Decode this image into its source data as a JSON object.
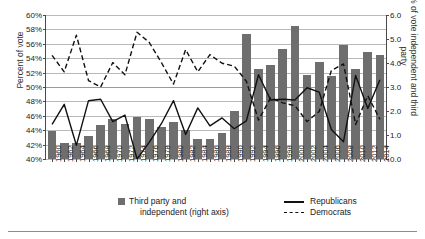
{
  "axes": {
    "ylabel_left": "Percent of vote",
    "ylabel_right": "% of vote independent and third party",
    "left_ticks": [
      "40%",
      "42%",
      "44%",
      "46%",
      "48%",
      "50%",
      "52%",
      "54%",
      "56%",
      "58%",
      "60%"
    ],
    "right_ticks": [
      "0.0",
      "1.0",
      "2.0",
      "3.0",
      "4.0",
      "5.0",
      "6.0"
    ]
  },
  "legend": {
    "bars_line1": "Third party and",
    "bars_line2": "independent (right axis)",
    "republicans": "Republicans",
    "democrats": "Democrats"
  },
  "colors": {
    "bar": "#6e6e6e",
    "republican_line": "#111111",
    "democrat_line": "#111111",
    "grid": "#b9b9b9",
    "axis": "#4a4a4a"
  },
  "chart_data": {
    "type": "bar",
    "title": "",
    "xlabel": "",
    "ylabel": "Percent of vote",
    "ylabel_secondary": "% of vote independent and third party",
    "ylim": [
      40,
      60
    ],
    "ylim_secondary": [
      0.0,
      6.0
    ],
    "grid": true,
    "legend_position": "bottom",
    "categories": [
      "1960",
      "1962",
      "1964",
      "1966",
      "1968",
      "1970",
      "1972",
      "1974",
      "1976",
      "1978",
      "1980",
      "1982",
      "1984",
      "1986",
      "1988",
      "1990",
      "1992",
      "1994",
      "1996",
      "1998",
      "2000",
      "2002",
      "2004",
      "2006",
      "2008",
      "2010",
      "2012",
      "2014"
    ],
    "series": [
      {
        "name": "Third party and independent (right axis)",
        "type": "bar",
        "axis": "right",
        "values": [
          1.15,
          0.65,
          0.65,
          0.95,
          1.4,
          1.65,
          1.45,
          1.75,
          1.65,
          1.35,
          1.55,
          1.2,
          0.85,
          0.85,
          1.1,
          2.0,
          5.2,
          3.75,
          3.9,
          4.6,
          5.55,
          3.5,
          4.05,
          3.45,
          4.75,
          3.75,
          4.45,
          4.35
        ]
      },
      {
        "name": "Republicans",
        "type": "line",
        "axis": "left",
        "style": "solid",
        "values": [
          44.8,
          47.6,
          41.9,
          48.1,
          48.3,
          45.2,
          46.1,
          40.0,
          42.3,
          44.9,
          48.1,
          43.4,
          47.1,
          44.6,
          45.7,
          44.2,
          45.3,
          51.7,
          48.2,
          48.3,
          48.2,
          49.9,
          49.3,
          44.1,
          42.4,
          51.6,
          47.0,
          51.0
        ]
      },
      {
        "name": "Democrats",
        "type": "line",
        "axis": "left",
        "style": "dashed",
        "values": [
          54.4,
          52.1,
          57.2,
          50.9,
          50.0,
          53.4,
          51.7,
          57.6,
          56.2,
          53.4,
          50.4,
          55.2,
          52.1,
          54.5,
          53.3,
          52.9,
          50.8,
          45.4,
          48.5,
          47.8,
          47.4,
          45.2,
          46.6,
          52.3,
          53.2,
          44.8,
          48.8,
          45.5
        ]
      }
    ]
  }
}
